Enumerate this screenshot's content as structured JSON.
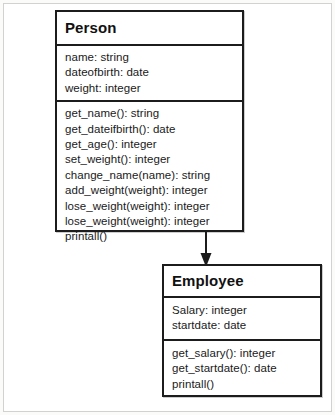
{
  "diagram": {
    "type": "uml-class-diagram",
    "background_color": "#fbfbfa",
    "line_color": "#1c1c1c",
    "classes": [
      {
        "id": "person",
        "name": "Person",
        "attributes": [
          "name: string",
          "dateofbirth: date",
          "weight: integer"
        ],
        "methods": [
          "get_name(): string",
          "get_dateifbirth(): date",
          "get_age(): integer",
          "set_weight(): integer",
          "change_name(name): string",
          "add_weight(weight): integer",
          "lose_weight(weight): integer",
          "lose_weight(weight): integer",
          "printall()"
        ]
      },
      {
        "id": "employee",
        "name": "Employee",
        "attributes": [
          "Salary: integer",
          "startdate: date"
        ],
        "methods": [
          "get_salary(): integer",
          "get_startdate(): date",
          "printall()"
        ]
      }
    ],
    "relationship": {
      "kind": "generalization",
      "from": "Person",
      "to": "Employee",
      "arrowhead": "filled-triangle",
      "direction": "down"
    }
  }
}
